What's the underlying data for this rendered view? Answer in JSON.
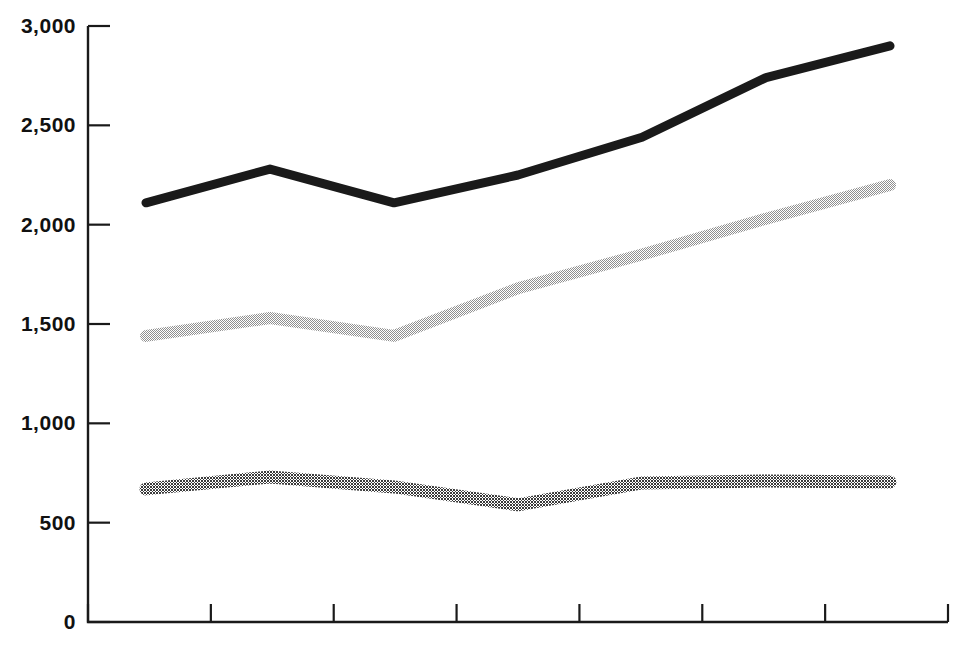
{
  "chart_data": {
    "type": "line",
    "title": "",
    "subtitle": "",
    "xlabel": "",
    "ylabel": "",
    "ylim": [
      0,
      3000
    ],
    "y_ticks": [
      0,
      500,
      1000,
      1500,
      2000,
      2500,
      3000
    ],
    "y_tick_labels": [
      "0",
      "500",
      "1,000",
      "1,500",
      "2,000",
      "2,500",
      "3,000"
    ],
    "x_ticks": [
      0,
      1,
      2,
      3,
      4,
      5,
      6,
      7
    ],
    "x_tick_labels": [
      "",
      "",
      "",
      "",
      "",
      "",
      "",
      ""
    ],
    "grid": false,
    "legend": "none",
    "x": [
      1,
      2,
      3,
      4,
      5,
      6,
      7
    ],
    "series": [
      {
        "name": "top-series",
        "style": "solid-black-thick",
        "color": "#1a1a1a",
        "values": [
          2110,
          2280,
          2110,
          2250,
          2440,
          2740,
          2900
        ]
      },
      {
        "name": "middle-series",
        "style": "light-dotted-fill",
        "color": "#b8b8b8",
        "values": [
          1440,
          1530,
          1440,
          1680,
          1850,
          2030,
          2200
        ]
      },
      {
        "name": "bottom-series",
        "style": "dark-checkered-fill",
        "color": "#4d4d4d",
        "values": [
          670,
          730,
          680,
          590,
          700,
          710,
          705
        ]
      }
    ]
  },
  "axis": {
    "tick_label_0": "0",
    "tick_label_500": "500",
    "tick_label_1000": "1,000",
    "tick_label_1500": "1,500",
    "tick_label_2000": "2,000",
    "tick_label_2500": "2,500",
    "tick_label_3000": "3,000"
  },
  "colors": {
    "background": "#ffffff",
    "axis": "#1a1a1a",
    "series_top": "#1a1a1a",
    "series_middle": "#b8b8b8",
    "series_bottom": "#4d4d4d"
  },
  "geometry": {
    "plot_left": 88,
    "plot_right": 948,
    "plot_top": 26,
    "plot_bottom": 622,
    "data_x_start": 146,
    "data_x_end": 890
  }
}
